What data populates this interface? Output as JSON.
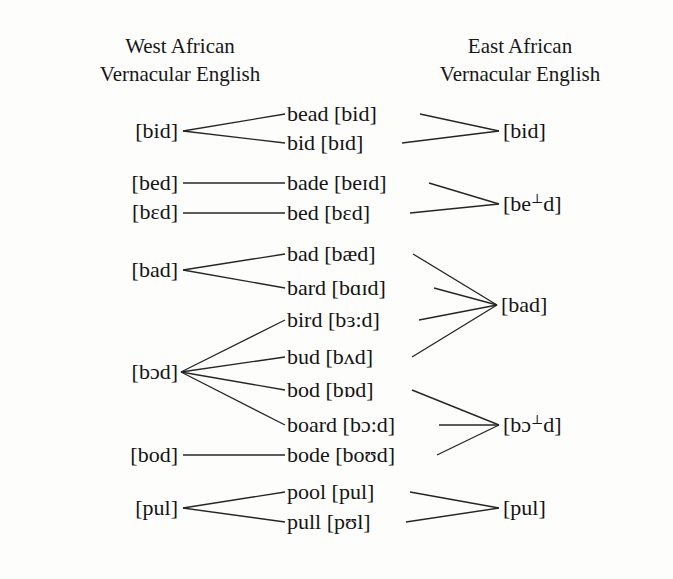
{
  "headers": {
    "west": {
      "line1": "West African",
      "line2": "Vernacular English"
    },
    "east": {
      "line1": "East African",
      "line2": "Vernacular English"
    }
  },
  "colors": {
    "ink": "#141414",
    "line": "#262626",
    "background": "#fdfdfb"
  },
  "left_column": [
    {
      "id": "l-bid",
      "label": "[bid]",
      "x": 180,
      "y": 131
    },
    {
      "id": "l-bed",
      "label": "[bed]",
      "x": 180,
      "y": 183
    },
    {
      "id": "l-beed",
      "label": "[bɛd]",
      "x": 180,
      "y": 212
    },
    {
      "id": "l-bad",
      "label": "[bad]",
      "x": 180,
      "y": 270
    },
    {
      "id": "l-bod",
      "label": "[bɔd]",
      "x": 180,
      "y": 372
    },
    {
      "id": "l-bode",
      "label": "[bod]",
      "x": 180,
      "y": 455
    },
    {
      "id": "l-pul",
      "label": "[pul]",
      "x": 180,
      "y": 508
    }
  ],
  "middle_column": [
    {
      "id": "m-bead",
      "word": "bead",
      "ipa": "[bid]",
      "label": "bead [bid]",
      "x_start": 287,
      "x_end": 418,
      "y": 114
    },
    {
      "id": "m-bid",
      "word": "bid",
      "ipa": "[bɪd]",
      "label": "bid [bɪd]",
      "x_start": 287,
      "x_end": 400,
      "y": 143
    },
    {
      "id": "m-bade",
      "word": "bade",
      "ipa": "[beɪd]",
      "label": "bade [beɪd]",
      "x_start": 287,
      "x_end": 427,
      "y": 183
    },
    {
      "id": "m-bed",
      "word": "bed",
      "ipa": "[bɛd]",
      "label": "bed [bɛd]",
      "x_start": 287,
      "x_end": 408,
      "y": 213
    },
    {
      "id": "m-bad",
      "word": "bad",
      "ipa": "[bæd]",
      "label": "bad [bæd]",
      "x_start": 287,
      "x_end": 411,
      "y": 254
    },
    {
      "id": "m-bard",
      "word": "bard",
      "ipa": "[bɑɪd]",
      "label": "bard [bɑɪd]",
      "x_start": 287,
      "x_end": 432,
      "y": 288
    },
    {
      "id": "m-bird",
      "word": "bird",
      "ipa": "[bɜ:d]",
      "label": "bird [bɜ:d]",
      "x_start": 287,
      "x_end": 417,
      "y": 320
    },
    {
      "id": "m-bud",
      "word": "bud",
      "ipa": "[bʌd]",
      "label": "bud [bʌd]",
      "x_start": 287,
      "x_end": 410,
      "y": 357
    },
    {
      "id": "m-bod",
      "word": "bod",
      "ipa": "[bɒd]",
      "label": "bod [bɒd]",
      "x_start": 287,
      "x_end": 410,
      "y": 390
    },
    {
      "id": "m-board",
      "word": "board",
      "ipa": "[bɔ:d]",
      "label": "board [bɔ:d]",
      "x_start": 287,
      "x_end": 437,
      "y": 425
    },
    {
      "id": "m-bode",
      "word": "bode",
      "ipa": "[boʊd]",
      "label": "bode [boʊd]",
      "x_start": 287,
      "x_end": 435,
      "y": 455
    },
    {
      "id": "m-pool",
      "word": "pool",
      "ipa": "[pul]",
      "label": "pool [pul]",
      "x_start": 287,
      "x_end": 408,
      "y": 492
    },
    {
      "id": "m-pull",
      "word": "pull",
      "ipa": "[pʊl]",
      "label": "pull [pʊl]",
      "x_start": 287,
      "x_end": 404,
      "y": 522
    }
  ],
  "right_column": [
    {
      "id": "r-bid",
      "label": "[bid]",
      "pre": "[bid]",
      "mark": "",
      "post": "",
      "x": 500,
      "y": 131
    },
    {
      "id": "r-bed",
      "label": "[be⊥d]",
      "pre": "[be",
      "mark": "⊥",
      "post": "d]",
      "x": 500,
      "y": 204
    },
    {
      "id": "r-bad",
      "label": "[bad]",
      "pre": "[bad]",
      "mark": "",
      "post": "",
      "x": 498,
      "y": 305
    },
    {
      "id": "r-bod",
      "label": "[bɔ⊥d]",
      "pre": "[bɔ",
      "mark": "⊥",
      "post": "d]",
      "x": 500,
      "y": 425
    },
    {
      "id": "r-pul",
      "label": "[pul]",
      "pre": "[pul]",
      "mark": "",
      "post": "",
      "x": 500,
      "y": 508
    }
  ],
  "links_left": [
    {
      "from": "l-bid",
      "to": "m-bead",
      "x1": 183,
      "y1": 131,
      "x2": 285,
      "y2": 114
    },
    {
      "from": "l-bid",
      "to": "m-bid",
      "x1": 183,
      "y1": 131,
      "x2": 285,
      "y2": 143
    },
    {
      "from": "l-bed",
      "to": "m-bade",
      "x1": 183,
      "y1": 183,
      "x2": 285,
      "y2": 183
    },
    {
      "from": "l-beed",
      "to": "m-bed",
      "x1": 183,
      "y1": 213,
      "x2": 285,
      "y2": 213
    },
    {
      "from": "l-bad",
      "to": "m-bad",
      "x1": 183,
      "y1": 270,
      "x2": 285,
      "y2": 254
    },
    {
      "from": "l-bad",
      "to": "m-bard",
      "x1": 183,
      "y1": 270,
      "x2": 285,
      "y2": 288
    },
    {
      "from": "l-bod",
      "to": "m-bird",
      "x1": 181,
      "y1": 372,
      "x2": 285,
      "y2": 320
    },
    {
      "from": "l-bod",
      "to": "m-bud",
      "x1": 181,
      "y1": 372,
      "x2": 285,
      "y2": 357
    },
    {
      "from": "l-bod",
      "to": "m-bod",
      "x1": 181,
      "y1": 372,
      "x2": 285,
      "y2": 390
    },
    {
      "from": "l-bod",
      "to": "m-board",
      "x1": 181,
      "y1": 372,
      "x2": 285,
      "y2": 425
    },
    {
      "from": "l-bode",
      "to": "m-bode",
      "x1": 183,
      "y1": 455,
      "x2": 285,
      "y2": 455
    },
    {
      "from": "l-pul",
      "to": "m-pool",
      "x1": 183,
      "y1": 508,
      "x2": 285,
      "y2": 492
    },
    {
      "from": "l-pul",
      "to": "m-pull",
      "x1": 183,
      "y1": 508,
      "x2": 285,
      "y2": 522
    }
  ],
  "links_right": [
    {
      "from": "m-bead",
      "to": "r-bid",
      "x1": 420,
      "y1": 114,
      "x2": 499,
      "y2": 131
    },
    {
      "from": "m-bid",
      "to": "r-bid",
      "x1": 402,
      "y1": 143,
      "x2": 499,
      "y2": 131
    },
    {
      "from": "m-bade",
      "to": "r-bed",
      "x1": 429,
      "y1": 183,
      "x2": 499,
      "y2": 204
    },
    {
      "from": "m-bed",
      "to": "r-bed",
      "x1": 410,
      "y1": 213,
      "x2": 499,
      "y2": 204
    },
    {
      "from": "m-bad",
      "to": "r-bad",
      "x1": 413,
      "y1": 254,
      "x2": 497,
      "y2": 305
    },
    {
      "from": "m-bard",
      "to": "r-bad",
      "x1": 434,
      "y1": 288,
      "x2": 497,
      "y2": 305
    },
    {
      "from": "m-bird",
      "to": "r-bad",
      "x1": 419,
      "y1": 320,
      "x2": 497,
      "y2": 305
    },
    {
      "from": "m-bud",
      "to": "r-bad",
      "x1": 412,
      "y1": 357,
      "x2": 497,
      "y2": 305
    },
    {
      "from": "m-bod",
      "to": "r-bod",
      "x1": 412,
      "y1": 390,
      "x2": 499,
      "y2": 425
    },
    {
      "from": "m-board",
      "to": "r-bod",
      "x1": 439,
      "y1": 425,
      "x2": 499,
      "y2": 425
    },
    {
      "from": "m-bode",
      "to": "r-bod",
      "x1": 437,
      "y1": 455,
      "x2": 499,
      "y2": 425
    },
    {
      "from": "m-pool",
      "to": "r-pul",
      "x1": 410,
      "y1": 492,
      "x2": 499,
      "y2": 508
    },
    {
      "from": "m-pull",
      "to": "r-pul",
      "x1": 406,
      "y1": 522,
      "x2": 499,
      "y2": 508
    }
  ]
}
